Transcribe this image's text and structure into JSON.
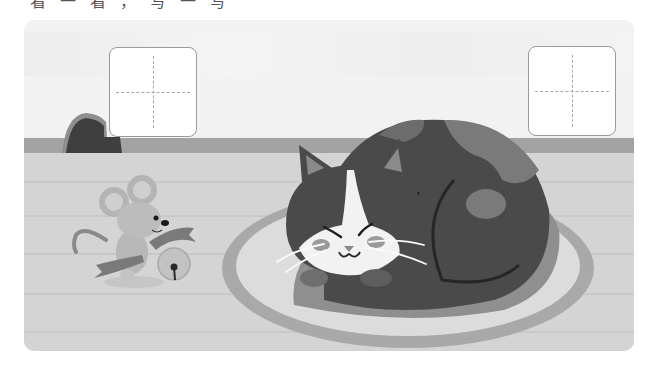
{
  "page": {
    "header_text_cutoff": "看一看，写一写"
  },
  "scene": {
    "description": "Illustration of a calico cat sleeping on an oval rug with a mouse holding a bell nearby",
    "colors": {
      "wall": "#f2f2f2",
      "baseboard": "#a3a3a3",
      "floor": "#d4d4d4",
      "rug_outer": "#a9a9a9",
      "rug_inner": "#dcdcdc",
      "cat_dark": "#4a4a4a",
      "cat_mid": "#7a7a7a",
      "cat_white": "#f5f5f5",
      "mouse": "#b8b8b8"
    }
  },
  "writing_boxes": [
    {
      "id": "left",
      "value": ""
    },
    {
      "id": "right",
      "value": ""
    }
  ]
}
